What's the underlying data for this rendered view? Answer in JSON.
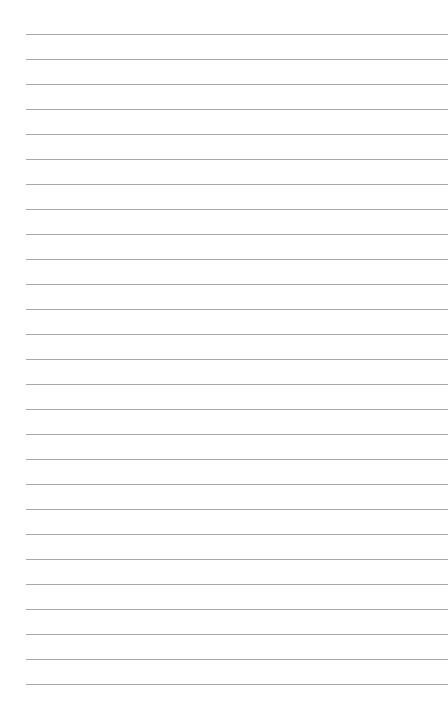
{
  "page": {
    "type": "lined-paper",
    "background": "#ffffff",
    "line_color": "#9a9a9a",
    "line_count": 27,
    "first_line_y": 34,
    "line_spacing": 25,
    "line_left": 26,
    "text": ""
  }
}
